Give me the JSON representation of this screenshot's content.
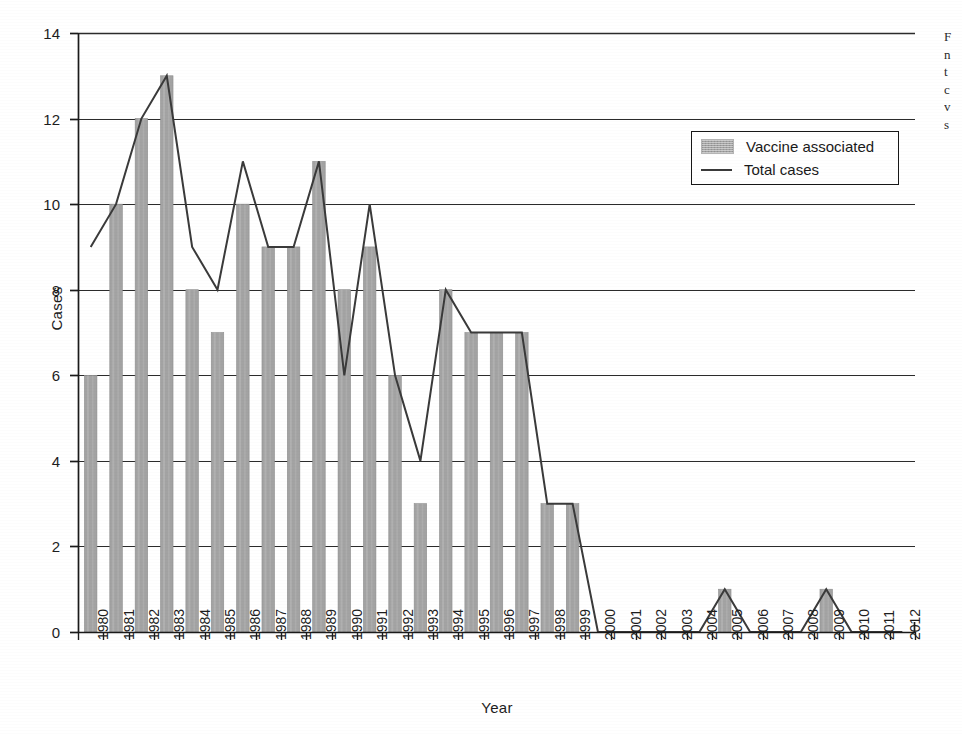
{
  "chart_data": {
    "type": "bar",
    "title": "",
    "xlabel": "Year",
    "ylabel": "Cases",
    "ylim": [
      0,
      14
    ],
    "y_ticks": [
      0,
      2,
      4,
      6,
      8,
      10,
      12,
      14
    ],
    "grid": "horizontal",
    "legend_position": "top-right",
    "categories": [
      "1980",
      "1981",
      "1982",
      "1983",
      "1984",
      "1985",
      "1986",
      "1987",
      "1988",
      "1989",
      "1990",
      "1991",
      "1992",
      "1993",
      "1994",
      "1995",
      "1996",
      "1997",
      "1998",
      "1999",
      "2000",
      "2001",
      "2002",
      "2003",
      "2004",
      "2005",
      "2006",
      "2007",
      "2008",
      "2009",
      "2010",
      "2011",
      "2012"
    ],
    "series": [
      {
        "name": "Vaccine associated",
        "render": "bar",
        "color": "#a3a3a3",
        "values": [
          6,
          10,
          12,
          13,
          8,
          7,
          10,
          9,
          9,
          11,
          8,
          9,
          6,
          3,
          8,
          7,
          7,
          7,
          3,
          3,
          0,
          0,
          0,
          0,
          0,
          1,
          0,
          0,
          0,
          1,
          0,
          0,
          0
        ]
      },
      {
        "name": "Total cases",
        "render": "line",
        "color": "#3a3a3a",
        "values": [
          9,
          10,
          12,
          13,
          9,
          8,
          11,
          9,
          9,
          11,
          6,
          10,
          6,
          4,
          8,
          7,
          7,
          7,
          3,
          3,
          0,
          0,
          0,
          0,
          0,
          1,
          0,
          0,
          0,
          1,
          0,
          0,
          0
        ]
      }
    ]
  },
  "legend": {
    "items": [
      {
        "label": "Vaccine associated",
        "marker": "bar-swatch"
      },
      {
        "label": "Total cases",
        "marker": "line-swatch"
      }
    ]
  },
  "axes": {
    "y_title": "Cases",
    "x_title": "Year"
  },
  "caption_fragment": {
    "lines": [
      "F",
      "n",
      "t",
      "c",
      "v",
      "s",
      "p",
      "c"
    ]
  },
  "colors": {
    "bar_fill": "#a3a3a3",
    "line": "#3a3a3a",
    "axis": "#1a1a1a",
    "gridline": "#2b2b2b",
    "background": "#ffffff"
  }
}
